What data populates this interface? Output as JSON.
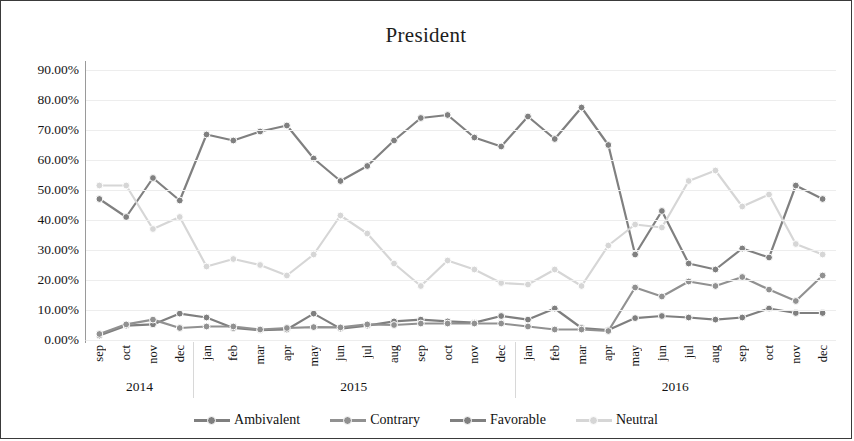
{
  "chart_data": {
    "type": "line",
    "title": "President",
    "xlabel": "",
    "ylabel": "",
    "ylim": [
      0,
      90
    ],
    "ytick_labels": [
      "90.00%",
      "80.00%",
      "70.00%",
      "60.00%",
      "50.00%",
      "40.00%",
      "30.00%",
      "20.00%",
      "10.00%",
      "0.00%"
    ],
    "ytick_values": [
      90,
      80,
      70,
      60,
      50,
      40,
      30,
      20,
      10,
      0
    ],
    "grid": true,
    "legend_position": "bottom",
    "categories": [
      "sep",
      "oct",
      "nov",
      "dec",
      "jan",
      "feb",
      "mar",
      "apr",
      "may",
      "jun",
      "jul",
      "aug",
      "sep",
      "oct",
      "nov",
      "dec",
      "jan",
      "feb",
      "mar",
      "apr",
      "may",
      "jun",
      "jul",
      "aug",
      "sep",
      "oct",
      "nov",
      "dec"
    ],
    "year_groups": [
      {
        "label": "2014",
        "start": 0,
        "count": 4
      },
      {
        "label": "2015",
        "start": 4,
        "count": 12
      },
      {
        "label": "2016",
        "start": 16,
        "count": 12
      }
    ],
    "series": [
      {
        "name": "Ambivalent",
        "color": "#7f7f7f",
        "values": [
          1.5,
          4.8,
          5.2,
          8.8,
          7.5,
          4.0,
          3.3,
          3.5,
          8.8,
          3.8,
          4.8,
          6.2,
          6.8,
          6.2,
          5.8,
          8.0,
          6.8,
          10.5,
          4.0,
          3.3,
          7.3,
          8.0,
          7.5,
          6.8,
          7.5,
          10.5,
          9.0,
          9.0
        ]
      },
      {
        "name": "Contrary",
        "color": "#919191",
        "values": [
          2.0,
          5.2,
          6.8,
          4.0,
          4.5,
          4.5,
          3.5,
          4.0,
          4.3,
          4.2,
          5.2,
          5.0,
          5.5,
          5.5,
          5.5,
          5.5,
          4.5,
          3.5,
          3.5,
          3.0,
          17.5,
          14.5,
          19.5,
          18.0,
          21.0,
          16.8,
          13.0,
          21.5
        ]
      },
      {
        "name": "Favorable",
        "color": "#808080",
        "values": [
          47.0,
          41.0,
          54.0,
          46.5,
          68.5,
          66.5,
          69.5,
          71.5,
          60.5,
          53.0,
          58.0,
          66.5,
          74.0,
          75.0,
          67.5,
          64.5,
          74.5,
          67.0,
          77.5,
          65.0,
          28.5,
          43.0,
          25.5,
          23.5,
          30.5,
          27.5,
          51.5,
          47.0
        ]
      },
      {
        "name": "Neutral",
        "color": "#d6d6d6",
        "values": [
          51.5,
          51.5,
          37.0,
          41.0,
          24.5,
          27.0,
          25.0,
          21.5,
          28.5,
          41.5,
          35.5,
          25.5,
          18.0,
          26.5,
          23.5,
          19.0,
          18.5,
          23.5,
          18.0,
          31.5,
          38.5,
          37.5,
          53.0,
          56.5,
          44.5,
          48.5,
          32.0,
          28.5
        ]
      }
    ]
  }
}
